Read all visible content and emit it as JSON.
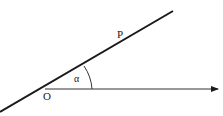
{
  "labels": {
    "origin": "O",
    "point": "P",
    "angle": "α"
  },
  "colors": {
    "ink": "#1a1a1a"
  }
}
